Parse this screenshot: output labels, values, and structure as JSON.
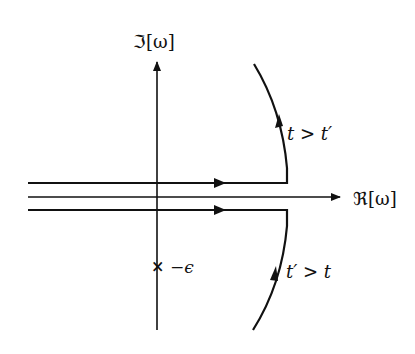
{
  "diagram": {
    "axes": {
      "imag_label": "ℑ[ω]",
      "real_label": "ℜ[ω]"
    },
    "pole": {
      "marker": "×",
      "label": "−ϵ"
    },
    "contours": [
      {
        "name": "upper",
        "label": "t > t′"
      },
      {
        "name": "lower",
        "label": "t′ > t"
      }
    ],
    "colors": {
      "ink": "#111111",
      "background": "#ffffff"
    }
  }
}
